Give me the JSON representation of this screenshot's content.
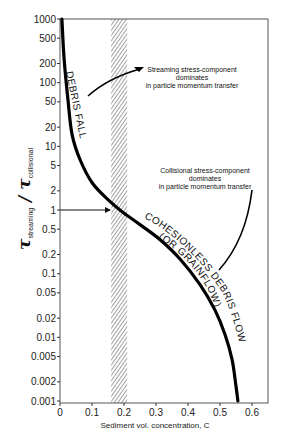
{
  "chart_data": {
    "type": "line",
    "title": "",
    "xlabel": "Sediment vol. concentration, C",
    "ylabel": "τ_streaming / τ_collisional",
    "ylabel_main": "τ",
    "ylabel_sub_num": "streaming",
    "ylabel_sub_den": "collisional",
    "xlim": [
      0,
      0.65
    ],
    "ylim": [
      0.001,
      1000
    ],
    "yscale": "log",
    "grid": false,
    "legend": null,
    "x_ticks": [
      "0",
      "0.1",
      "0.2",
      "0.3",
      "0.4",
      "0.5",
      "0.6"
    ],
    "x_tick_values": [
      0,
      0.1,
      0.2,
      0.3,
      0.4,
      0.5,
      0.6
    ],
    "y_ticks": [
      "1000",
      "500",
      "200",
      "100",
      "50",
      "20",
      "10",
      "5",
      "2",
      "1",
      "0.5",
      "0.2",
      "0.1",
      "0.05",
      "0.02",
      "0.01",
      "0.005",
      "0.002",
      "0.001"
    ],
    "y_tick_values": [
      1000,
      500,
      200,
      100,
      50,
      20,
      10,
      5,
      2,
      1,
      0.5,
      0.2,
      0.1,
      0.05,
      0.02,
      0.01,
      0.005,
      0.002,
      0.001
    ],
    "series": [
      {
        "name": "Stress ratio curve",
        "x": [
          0.006,
          0.013,
          0.025,
          0.038,
          0.063,
          0.1,
          0.15,
          0.194,
          0.25,
          0.313,
          0.375,
          0.438,
          0.484,
          0.516,
          0.538,
          0.55,
          0.556
        ],
        "y": [
          1000,
          227,
          53,
          15,
          6.1,
          2.7,
          1.45,
          0.94,
          0.59,
          0.34,
          0.17,
          0.067,
          0.027,
          0.011,
          0.0044,
          0.0017,
          0.001
        ]
      }
    ],
    "shaded_band": {
      "x_from": 0.16,
      "x_to": 0.21,
      "pattern": "diagonal hatch"
    },
    "reference_line": {
      "y": 1,
      "style": "arrow from y-axis to curve"
    },
    "annotations": [
      {
        "text": [
          "Streaming stress-component",
          "dominates",
          "in particle momentum transfer"
        ],
        "points_to": "upper branch (debris fall)"
      },
      {
        "text": [
          "Collisional stress-component",
          "dominates",
          "in particle momentum transfer"
        ],
        "points_to": "lower branch (cohesionless debris flow)"
      }
    ],
    "curve_labels": [
      "DEBRIS FALL",
      "COHESIONLESS DEBRIS FLOW",
      "(OR GRAINFLOW)"
    ]
  },
  "colors": {
    "curve": "#000000",
    "axis": "#333333",
    "hatch": "#444444",
    "background": "#ffffff"
  }
}
